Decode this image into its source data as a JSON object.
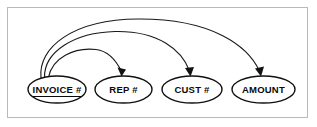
{
  "diagram": {
    "kind": "functional-dependency-diagram",
    "background_color": "#ffffff",
    "frame_border_color": "#b9b9b9",
    "line_color": "#1a1a1a",
    "text_color": "#0a0a0a",
    "nodes": [
      {
        "id": "invoice-number",
        "label": "INVOICE #",
        "is_primary_key": true,
        "underlined": true,
        "cx": 57,
        "cy": 89.5,
        "rx": 29,
        "ry": 13.5
      },
      {
        "id": "rep-number",
        "label": "REP #",
        "is_primary_key": false,
        "underlined": false,
        "cx": 123.5,
        "cy": 89.5,
        "rx": 28.5,
        "ry": 13.5
      },
      {
        "id": "cust-number",
        "label": "CUST #",
        "is_primary_key": false,
        "underlined": false,
        "cx": 192,
        "cy": 89.5,
        "rx": 30,
        "ry": 13.5
      },
      {
        "id": "amount",
        "label": "AMOUNT",
        "is_primary_key": false,
        "underlined": false,
        "cx": 263.5,
        "cy": 89.5,
        "rx": 31.5,
        "ry": 13.5
      }
    ],
    "arrows": [
      {
        "id": "invoice-to-rep",
        "from": "invoice-number",
        "to": "rep-number",
        "path": "M 48.5 77.5 C 52 58 74 47 96 49.5 C 108 51 116 60 121.5 71.5",
        "head": "121.5,76.5 117.5,67.5 126.0,69.5"
      },
      {
        "id": "invoice-to-cust",
        "from": "invoice-number",
        "to": "amount",
        "path": "M 44.5 77.5 C 44 52 74 32.5 115 31.5 C 158 30.5 182 50 189.5 71.0",
        "head": "190.5,76.5 185.0,68.0 194.0,67.0"
      },
      {
        "id": "invoice-to-amount",
        "from": "invoice-number",
        "to": "cust-number",
        "path": "M 41.0 77.5 C 38 48 72 19.5 138 19.0 C 212 18.5 248 46 259.5 71.0",
        "head": "261.0,76.5 255.0,68.5 264.0,66.5"
      }
    ]
  }
}
